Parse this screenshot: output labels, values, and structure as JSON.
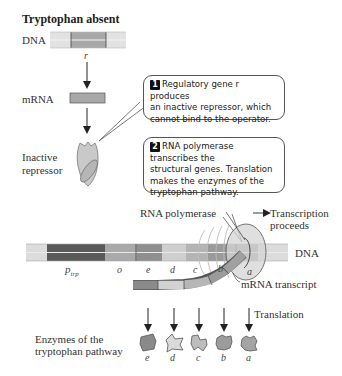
{
  "title": "Tryptophan absent",
  "labels": {
    "dna_top": "DNA",
    "gene_r": "r",
    "mrna": "mRNA",
    "inactive_repressor_line1": "Inactive",
    "inactive_repressor_line2": "repressor",
    "rna_polymerase": "RNA polymerase",
    "transcription_line1": "Transcription",
    "transcription_line2": "proceeds",
    "dna_main": "DNA",
    "mrna_transcript": "mRNA transcript",
    "translation": "Translation",
    "enzymes_line1": "Enzymes of the",
    "enzymes_line2": "tryptophan pathway"
  },
  "callouts": [
    {
      "number": "1",
      "lines": [
        "Regulatory gene r produces",
        "an inactive repressor, which",
        "cannot bind to the operator."
      ]
    },
    {
      "number": "2",
      "lines": [
        "RNA polymerase transcribes the",
        "structural genes. Translation",
        "makes the enzymes of the",
        "tryptophan pathway."
      ]
    }
  ],
  "dna_segments": {
    "promoter": {
      "label": "p",
      "subscript": "trp"
    },
    "genes": [
      "o",
      "e",
      "d",
      "c",
      "b",
      "a"
    ]
  },
  "enzymes": [
    "e",
    "d",
    "c",
    "b",
    "a"
  ],
  "colors": {
    "dna_light": "#dcdcdc",
    "promoter": "#5a5a5a",
    "operator": "#a9a9a9",
    "gene_e": "#8f8f8f",
    "gene_d": "#cfcfcf",
    "gene_c": "#b4b4b4",
    "gene_b": "#9a9a9a",
    "gene_a": "#a0a0a0",
    "repressor": "#c9c9c9"
  }
}
